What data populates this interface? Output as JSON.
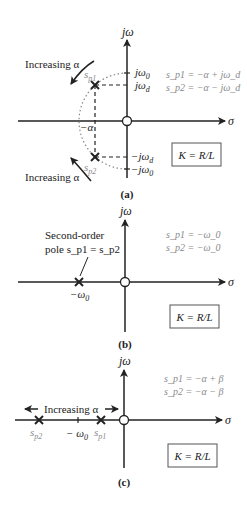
{
  "panels": [
    {
      "id": "a",
      "caption": "(a)",
      "axis_imag": "jω",
      "axis_real": "σ",
      "labels": {
        "jw0": "jω",
        "jw0_sub": "0",
        "jwd": "jω",
        "jwd_sub": "d",
        "neg_jwd": "−jω",
        "neg_jwd_sub": "d",
        "neg_jw0": "−jω",
        "neg_jw0_sub": "0",
        "neg_alpha": "−α",
        "sp1": "s",
        "sp1_sub": "p1",
        "sp2": "s",
        "sp2_sub": "p2"
      },
      "increasing_top": "Increasing α",
      "increasing_bottom": "Increasing α",
      "eq1": "s_p1 = −α + jω_d",
      "eq2": "s_p2 = −α − jω_d",
      "box": "K = R/L"
    },
    {
      "id": "b",
      "caption": "(b)",
      "axis_imag": "jω",
      "axis_real": "σ",
      "pole_label_line1": "Second-order",
      "pole_label_line2": "pole s_p1 = s_p2",
      "neg_w0": "−ω",
      "neg_w0_sub": "0",
      "eq1": "s_p1 = −ω_0",
      "eq2": "s_p2 = −ω_0",
      "box": "K = R/L"
    },
    {
      "id": "c",
      "caption": "(c)",
      "axis_imag": "jω",
      "axis_real": "σ",
      "increasing": "Increasing α",
      "neg_w0": "− ω",
      "neg_w0_sub": "0",
      "sp1": "s",
      "sp1_sub": "p1",
      "sp2": "s",
      "sp2_sub": "p2",
      "eq1": "s_p1 = −α + β",
      "eq2": "s_p2 = −α − β",
      "box": "K = R/L"
    }
  ]
}
